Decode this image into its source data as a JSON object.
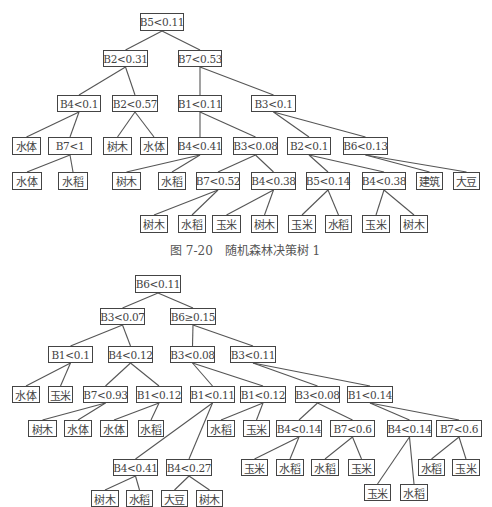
{
  "tree1": {
    "caption": "图 7-20　随机森林决策树 1",
    "caption_pos": [
      170,
      241
    ],
    "nodes": [
      {
        "id": "t1n0",
        "label": "B5<0.11",
        "type": "split",
        "x": 140,
        "y": 13,
        "w": 44,
        "h": 18
      },
      {
        "id": "t1n1",
        "label": "B2<0.31",
        "type": "split",
        "x": 103,
        "y": 50,
        "w": 45,
        "h": 17
      },
      {
        "id": "t1n2",
        "label": "B7<0.53",
        "type": "split",
        "x": 178,
        "y": 50,
        "w": 44,
        "h": 17
      },
      {
        "id": "t1n3",
        "label": "B4<0.1",
        "type": "split",
        "x": 57,
        "y": 95,
        "w": 44,
        "h": 17
      },
      {
        "id": "t1n4",
        "label": "B2<0.57",
        "type": "split",
        "x": 112,
        "y": 95,
        "w": 46,
        "h": 17
      },
      {
        "id": "t1n5",
        "label": "B1<0.11",
        "type": "split",
        "x": 178,
        "y": 95,
        "w": 44,
        "h": 17
      },
      {
        "id": "t1n6",
        "label": "B3<0.1",
        "type": "split",
        "x": 251,
        "y": 95,
        "w": 45,
        "h": 17
      },
      {
        "id": "t1n7",
        "label": "水体",
        "type": "leaf",
        "x": 12,
        "y": 137,
        "w": 29,
        "h": 18
      },
      {
        "id": "t1n8",
        "label": "B7<1",
        "type": "split",
        "x": 48,
        "y": 137,
        "w": 44,
        "h": 18
      },
      {
        "id": "t1n9",
        "label": "树木",
        "type": "leaf",
        "x": 103,
        "y": 137,
        "w": 29,
        "h": 18
      },
      {
        "id": "t1n10",
        "label": "水体",
        "type": "leaf",
        "x": 140,
        "y": 137,
        "w": 28,
        "h": 18
      },
      {
        "id": "t1n11",
        "label": "B4<0.41",
        "type": "split",
        "x": 178,
        "y": 137,
        "w": 44,
        "h": 18
      },
      {
        "id": "t1n12",
        "label": "B3<0.08",
        "type": "split",
        "x": 233,
        "y": 137,
        "w": 45,
        "h": 18
      },
      {
        "id": "t1n13",
        "label": "B2<0.1",
        "type": "split",
        "x": 287,
        "y": 137,
        "w": 44,
        "h": 18
      },
      {
        "id": "t1n14",
        "label": "B6<0.13",
        "type": "split",
        "x": 343,
        "y": 137,
        "w": 45,
        "h": 18
      },
      {
        "id": "t1n15",
        "label": "水体",
        "type": "leaf",
        "x": 12,
        "y": 172,
        "w": 30,
        "h": 18
      },
      {
        "id": "t1n16",
        "label": "水稻",
        "type": "leaf",
        "x": 58,
        "y": 172,
        "w": 30,
        "h": 18
      },
      {
        "id": "t1n17",
        "label": "树木",
        "type": "leaf",
        "x": 112,
        "y": 172,
        "w": 29,
        "h": 18
      },
      {
        "id": "t1n18",
        "label": "水稻",
        "type": "leaf",
        "x": 158,
        "y": 172,
        "w": 28,
        "h": 18
      },
      {
        "id": "t1n19",
        "label": "B7<0.52",
        "type": "split",
        "x": 196,
        "y": 172,
        "w": 44,
        "h": 18
      },
      {
        "id": "t1n20",
        "label": "B4<0.38",
        "type": "split",
        "x": 251,
        "y": 172,
        "w": 45,
        "h": 18
      },
      {
        "id": "t1n21",
        "label": "B5<0.14",
        "type": "split",
        "x": 306,
        "y": 172,
        "w": 44,
        "h": 18
      },
      {
        "id": "t1n22",
        "label": "B4<0.38",
        "type": "split",
        "x": 362,
        "y": 172,
        "w": 44,
        "h": 18
      },
      {
        "id": "t1n23",
        "label": "建筑",
        "type": "leaf",
        "x": 416,
        "y": 172,
        "w": 27,
        "h": 18
      },
      {
        "id": "t1n24",
        "label": "大豆",
        "type": "leaf",
        "x": 453,
        "y": 172,
        "w": 27,
        "h": 18
      },
      {
        "id": "t1n25",
        "label": "树木",
        "type": "leaf",
        "x": 140,
        "y": 215,
        "w": 28,
        "h": 18
      },
      {
        "id": "t1n26",
        "label": "水稻",
        "type": "leaf",
        "x": 178,
        "y": 215,
        "w": 28,
        "h": 18
      },
      {
        "id": "t1n27",
        "label": "玉米",
        "type": "leaf",
        "x": 212,
        "y": 215,
        "w": 29,
        "h": 18
      },
      {
        "id": "t1n28",
        "label": "树木",
        "type": "leaf",
        "x": 251,
        "y": 215,
        "w": 27,
        "h": 18
      },
      {
        "id": "t1n29",
        "label": "玉米",
        "type": "leaf",
        "x": 288,
        "y": 215,
        "w": 28,
        "h": 18
      },
      {
        "id": "t1n30",
        "label": "水稻",
        "type": "leaf",
        "x": 325,
        "y": 215,
        "w": 27,
        "h": 18
      },
      {
        "id": "t1n31",
        "label": "玉米",
        "type": "leaf",
        "x": 362,
        "y": 215,
        "w": 28,
        "h": 18
      },
      {
        "id": "t1n32",
        "label": "树木",
        "type": "leaf",
        "x": 400,
        "y": 215,
        "w": 28,
        "h": 18
      }
    ],
    "edges": [
      [
        "t1n0",
        "t1n1"
      ],
      [
        "t1n0",
        "t1n2"
      ],
      [
        "t1n1",
        "t1n3"
      ],
      [
        "t1n1",
        "t1n4"
      ],
      [
        "t1n2",
        "t1n5"
      ],
      [
        "t1n2",
        "t1n6"
      ],
      [
        "t1n3",
        "t1n7"
      ],
      [
        "t1n3",
        "t1n8"
      ],
      [
        "t1n4",
        "t1n9"
      ],
      [
        "t1n4",
        "t1n10"
      ],
      [
        "t1n5",
        "t1n11"
      ],
      [
        "t1n5",
        "t1n12"
      ],
      [
        "t1n6",
        "t1n13"
      ],
      [
        "t1n6",
        "t1n14"
      ],
      [
        "t1n8",
        "t1n15"
      ],
      [
        "t1n8",
        "t1n16"
      ],
      [
        "t1n11",
        "t1n17"
      ],
      [
        "t1n11",
        "t1n18"
      ],
      [
        "t1n12",
        "t1n19"
      ],
      [
        "t1n12",
        "t1n20"
      ],
      [
        "t1n13",
        "t1n21"
      ],
      [
        "t1n13",
        "t1n22"
      ],
      [
        "t1n14",
        "t1n23"
      ],
      [
        "t1n14",
        "t1n24"
      ],
      [
        "t1n19",
        "t1n25"
      ],
      [
        "t1n19",
        "t1n26"
      ],
      [
        "t1n20",
        "t1n27"
      ],
      [
        "t1n20",
        "t1n28"
      ],
      [
        "t1n21",
        "t1n29"
      ],
      [
        "t1n21",
        "t1n30"
      ],
      [
        "t1n22",
        "t1n31"
      ],
      [
        "t1n22",
        "t1n32"
      ]
    ]
  },
  "tree2": {
    "nodes": [
      {
        "id": "t2n0",
        "label": "B6<0.11",
        "type": "split",
        "x": 135,
        "y": 275,
        "w": 46,
        "h": 18
      },
      {
        "id": "t2n1",
        "label": "B3<0.07",
        "type": "split",
        "x": 100,
        "y": 308,
        "w": 45,
        "h": 17
      },
      {
        "id": "t2n2",
        "label": "B6≥0.15",
        "type": "split",
        "x": 170,
        "y": 308,
        "w": 46,
        "h": 17
      },
      {
        "id": "t2n3",
        "label": "B1<0.1",
        "type": "split",
        "x": 48,
        "y": 346,
        "w": 45,
        "h": 17
      },
      {
        "id": "t2n4",
        "label": "B4<0.12",
        "type": "split",
        "x": 108,
        "y": 346,
        "w": 45,
        "h": 17
      },
      {
        "id": "t2n5",
        "label": "B3<0.08",
        "type": "split",
        "x": 170,
        "y": 346,
        "w": 45,
        "h": 17
      },
      {
        "id": "t2n6",
        "label": "B3<0.11",
        "type": "split",
        "x": 230,
        "y": 346,
        "w": 46,
        "h": 17
      },
      {
        "id": "t2n7",
        "label": "水体",
        "type": "leaf",
        "x": 12,
        "y": 386,
        "w": 28,
        "h": 17
      },
      {
        "id": "t2n8",
        "label": "玉米",
        "type": "leaf",
        "x": 48,
        "y": 386,
        "w": 25,
        "h": 17
      },
      {
        "id": "t2n9",
        "label": "B7<0.93",
        "type": "split",
        "x": 83,
        "y": 386,
        "w": 45,
        "h": 17
      },
      {
        "id": "t2n10",
        "label": "B1<0.12",
        "type": "split",
        "x": 136,
        "y": 386,
        "w": 46,
        "h": 17
      },
      {
        "id": "t2n11",
        "label": "B1<0.11",
        "type": "split",
        "x": 190,
        "y": 386,
        "w": 45,
        "h": 17
      },
      {
        "id": "t2n12",
        "label": "B1<0.12",
        "type": "split",
        "x": 240,
        "y": 386,
        "w": 46,
        "h": 17
      },
      {
        "id": "t2n13",
        "label": "B3<0.08",
        "type": "split",
        "x": 295,
        "y": 386,
        "w": 45,
        "h": 17
      },
      {
        "id": "t2n14",
        "label": "B1<0.14",
        "type": "split",
        "x": 347,
        "y": 386,
        "w": 46,
        "h": 17
      },
      {
        "id": "t2n15",
        "label": "树木",
        "type": "leaf",
        "x": 28,
        "y": 420,
        "w": 29,
        "h": 17
      },
      {
        "id": "t2n16",
        "label": "水体",
        "type": "leaf",
        "x": 64,
        "y": 420,
        "w": 28,
        "h": 17
      },
      {
        "id": "t2n17",
        "label": "水体",
        "type": "leaf",
        "x": 100,
        "y": 420,
        "w": 28,
        "h": 17
      },
      {
        "id": "t2n18",
        "label": "水稻",
        "type": "leaf",
        "x": 138,
        "y": 420,
        "w": 26,
        "h": 17
      },
      {
        "id": "t2n19",
        "label": "水稻",
        "type": "leaf",
        "x": 207,
        "y": 420,
        "w": 28,
        "h": 17
      },
      {
        "id": "t2n20",
        "label": "玉米",
        "type": "leaf",
        "x": 243,
        "y": 420,
        "w": 27,
        "h": 17
      },
      {
        "id": "t2n21",
        "label": "B4<0.14",
        "type": "split",
        "x": 276,
        "y": 420,
        "w": 46,
        "h": 17
      },
      {
        "id": "t2n22",
        "label": "B7<0.6",
        "type": "split",
        "x": 330,
        "y": 420,
        "w": 45,
        "h": 17
      },
      {
        "id": "t2n23",
        "label": "B4<0.14",
        "type": "split",
        "x": 387,
        "y": 420,
        "w": 45,
        "h": 17
      },
      {
        "id": "t2n24",
        "label": "B7<0.6",
        "type": "split",
        "x": 436,
        "y": 420,
        "w": 46,
        "h": 17
      },
      {
        "id": "t2n25",
        "label": "B4<0.41",
        "type": "split",
        "x": 113,
        "y": 459,
        "w": 45,
        "h": 17
      },
      {
        "id": "t2n26",
        "label": "B4<0.27",
        "type": "split",
        "x": 166,
        "y": 459,
        "w": 46,
        "h": 17
      },
      {
        "id": "t2n27",
        "label": "玉米",
        "type": "leaf",
        "x": 241,
        "y": 459,
        "w": 27,
        "h": 17
      },
      {
        "id": "t2n28",
        "label": "水稻",
        "type": "leaf",
        "x": 276,
        "y": 459,
        "w": 28,
        "h": 17
      },
      {
        "id": "t2n29",
        "label": "水稻",
        "type": "leaf",
        "x": 311,
        "y": 459,
        "w": 28,
        "h": 17
      },
      {
        "id": "t2n30",
        "label": "玉米",
        "type": "leaf",
        "x": 348,
        "y": 459,
        "w": 27,
        "h": 17
      },
      {
        "id": "t2n31",
        "label": "水稻",
        "type": "leaf",
        "x": 418,
        "y": 459,
        "w": 27,
        "h": 17
      },
      {
        "id": "t2n32",
        "label": "玉米",
        "type": "leaf",
        "x": 452,
        "y": 459,
        "w": 28,
        "h": 17
      },
      {
        "id": "t2n33",
        "label": "树木",
        "type": "leaf",
        "x": 91,
        "y": 490,
        "w": 28,
        "h": 17
      },
      {
        "id": "t2n34",
        "label": "水稻",
        "type": "leaf",
        "x": 126,
        "y": 490,
        "w": 27,
        "h": 17
      },
      {
        "id": "t2n35",
        "label": "大豆",
        "type": "leaf",
        "x": 161,
        "y": 490,
        "w": 27,
        "h": 17
      },
      {
        "id": "t2n36",
        "label": "树木",
        "type": "leaf",
        "x": 196,
        "y": 490,
        "w": 27,
        "h": 17
      },
      {
        "id": "t2n37",
        "label": "玉米",
        "type": "leaf",
        "x": 364,
        "y": 484,
        "w": 27,
        "h": 17
      },
      {
        "id": "t2n38",
        "label": "水稻",
        "type": "leaf",
        "x": 400,
        "y": 484,
        "w": 28,
        "h": 17
      }
    ],
    "edges": [
      [
        "t2n0",
        "t2n1"
      ],
      [
        "t2n0",
        "t2n2"
      ],
      [
        "t2n1",
        "t2n3"
      ],
      [
        "t2n1",
        "t2n4"
      ],
      [
        "t2n2",
        "t2n5"
      ],
      [
        "t2n2",
        "t2n6"
      ],
      [
        "t2n3",
        "t2n7"
      ],
      [
        "t2n3",
        "t2n8"
      ],
      [
        "t2n4",
        "t2n9"
      ],
      [
        "t2n4",
        "t2n10"
      ],
      [
        "t2n5",
        "t2n11"
      ],
      [
        "t2n5",
        "t2n12"
      ],
      [
        "t2n6",
        "t2n13"
      ],
      [
        "t2n6",
        "t2n14"
      ],
      [
        "t2n9",
        "t2n15"
      ],
      [
        "t2n9",
        "t2n16"
      ],
      [
        "t2n10",
        "t2n17"
      ],
      [
        "t2n10",
        "t2n18"
      ],
      [
        "t2n11",
        "t2n25"
      ],
      [
        "t2n11",
        "t2n26"
      ],
      [
        "t2n12",
        "t2n19"
      ],
      [
        "t2n12",
        "t2n20"
      ],
      [
        "t2n13",
        "t2n21"
      ],
      [
        "t2n13",
        "t2n22"
      ],
      [
        "t2n14",
        "t2n23"
      ],
      [
        "t2n14",
        "t2n24"
      ],
      [
        "t2n21",
        "t2n27"
      ],
      [
        "t2n21",
        "t2n28"
      ],
      [
        "t2n22",
        "t2n29"
      ],
      [
        "t2n22",
        "t2n30"
      ],
      [
        "t2n23",
        "t2n37"
      ],
      [
        "t2n23",
        "t2n38"
      ],
      [
        "t2n24",
        "t2n31"
      ],
      [
        "t2n24",
        "t2n32"
      ],
      [
        "t2n25",
        "t2n33"
      ],
      [
        "t2n25",
        "t2n34"
      ],
      [
        "t2n26",
        "t2n35"
      ],
      [
        "t2n26",
        "t2n36"
      ]
    ]
  },
  "colors": {
    "border": "#444444",
    "edge": "#555555",
    "text": "#444444",
    "background": "#ffffff"
  }
}
